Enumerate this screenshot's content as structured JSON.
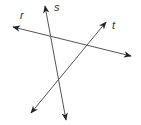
{
  "diagram": {
    "line_color": "#555555",
    "lines": [
      {
        "id": "r",
        "label": "r"
      },
      {
        "id": "s",
        "label": "s"
      },
      {
        "id": "t",
        "label": "t"
      }
    ]
  }
}
